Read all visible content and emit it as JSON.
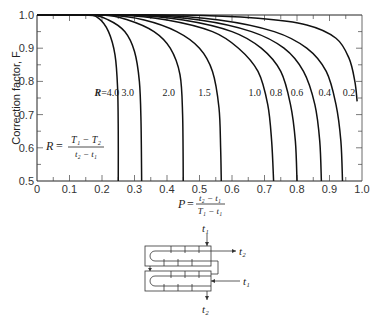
{
  "chart_data": {
    "type": "line",
    "title": "",
    "xlabel": "P = (t2 - t1) / (T1 - t1)",
    "ylabel": "Correction factor, F",
    "xlim": [
      0,
      1.0
    ],
    "ylim": [
      0.5,
      1.0
    ],
    "xticks": [
      "0",
      "0.1",
      "0.2",
      "0.3",
      "0.4",
      "0.5",
      "0.6",
      "0.7",
      "0.8",
      "0.9",
      "1.0"
    ],
    "yticks": [
      "0.5",
      "0.6",
      "0.7",
      "0.8",
      "0.9",
      "1.0"
    ],
    "grid": false,
    "parameter_legend": "R = (T1 - T2) / (t2 - t1)",
    "series": [
      {
        "name": "R=4.0",
        "label": "R=4.0",
        "points": [
          [
            0.0,
            1.0
          ],
          [
            0.15,
            1.0
          ],
          [
            0.19,
            0.99
          ],
          [
            0.22,
            0.95
          ],
          [
            0.24,
            0.88
          ],
          [
            0.248,
            0.78
          ],
          [
            0.25,
            0.65
          ],
          [
            0.25,
            0.5
          ]
        ]
      },
      {
        "name": "R=3.0",
        "label": "3.0",
        "points": [
          [
            0.0,
            1.0
          ],
          [
            0.16,
            1.0
          ],
          [
            0.22,
            0.985
          ],
          [
            0.27,
            0.95
          ],
          [
            0.3,
            0.89
          ],
          [
            0.315,
            0.8
          ],
          [
            0.32,
            0.68
          ],
          [
            0.322,
            0.5
          ]
        ]
      },
      {
        "name": "R=2.0",
        "label": "2.0",
        "points": [
          [
            0.0,
            1.0
          ],
          [
            0.2,
            1.0
          ],
          [
            0.28,
            0.985
          ],
          [
            0.36,
            0.95
          ],
          [
            0.41,
            0.9
          ],
          [
            0.44,
            0.82
          ],
          [
            0.448,
            0.7
          ],
          [
            0.45,
            0.5
          ]
        ]
      },
      {
        "name": "R=1.5",
        "label": "1.5",
        "points": [
          [
            0.0,
            1.0
          ],
          [
            0.22,
            1.0
          ],
          [
            0.33,
            0.985
          ],
          [
            0.43,
            0.95
          ],
          [
            0.5,
            0.9
          ],
          [
            0.54,
            0.83
          ],
          [
            0.56,
            0.72
          ],
          [
            0.565,
            0.6
          ],
          [
            0.567,
            0.5
          ]
        ]
      },
      {
        "name": "R=1.0",
        "label": "1.0",
        "points": [
          [
            0.0,
            1.0
          ],
          [
            0.25,
            1.0
          ],
          [
            0.4,
            0.985
          ],
          [
            0.54,
            0.95
          ],
          [
            0.62,
            0.9
          ],
          [
            0.68,
            0.83
          ],
          [
            0.71,
            0.73
          ],
          [
            0.722,
            0.62
          ],
          [
            0.728,
            0.5
          ]
        ]
      },
      {
        "name": "R=0.8",
        "label": "0.8",
        "points": [
          [
            0.0,
            1.0
          ],
          [
            0.28,
            1.0
          ],
          [
            0.45,
            0.985
          ],
          [
            0.6,
            0.95
          ],
          [
            0.69,
            0.9
          ],
          [
            0.75,
            0.83
          ],
          [
            0.78,
            0.73
          ],
          [
            0.795,
            0.62
          ],
          [
            0.8,
            0.5
          ]
        ]
      },
      {
        "name": "R=0.6",
        "label": "0.6",
        "points": [
          [
            0.0,
            1.0
          ],
          [
            0.3,
            1.0
          ],
          [
            0.5,
            0.985
          ],
          [
            0.66,
            0.95
          ],
          [
            0.76,
            0.9
          ],
          [
            0.82,
            0.83
          ],
          [
            0.855,
            0.73
          ],
          [
            0.87,
            0.62
          ],
          [
            0.875,
            0.5
          ]
        ]
      },
      {
        "name": "R=0.4",
        "label": "0.4",
        "points": [
          [
            0.0,
            1.0
          ],
          [
            0.35,
            1.0
          ],
          [
            0.56,
            0.985
          ],
          [
            0.73,
            0.95
          ],
          [
            0.83,
            0.9
          ],
          [
            0.89,
            0.83
          ],
          [
            0.92,
            0.73
          ],
          [
            0.935,
            0.62
          ],
          [
            0.94,
            0.5
          ]
        ]
      },
      {
        "name": "R=0.2",
        "label": "0.2",
        "points": [
          [
            0.0,
            1.0
          ],
          [
            0.45,
            1.0
          ],
          [
            0.68,
            0.99
          ],
          [
            0.83,
            0.97
          ],
          [
            0.92,
            0.93
          ],
          [
            0.96,
            0.87
          ],
          [
            0.978,
            0.8
          ],
          [
            0.985,
            0.74
          ]
        ]
      }
    ],
    "curve_label_positions": [
      {
        "label": "R=4.0",
        "x": 0.215,
        "y": 0.757
      },
      {
        "label": "3.0",
        "x": 0.279,
        "y": 0.757
      },
      {
        "label": "2.0",
        "x": 0.405,
        "y": 0.757
      },
      {
        "label": "1.5",
        "x": 0.515,
        "y": 0.757
      },
      {
        "label": "1.0",
        "x": 0.67,
        "y": 0.757
      },
      {
        "label": "0.8",
        "x": 0.735,
        "y": 0.757
      },
      {
        "label": "0.6",
        "x": 0.8,
        "y": 0.757
      },
      {
        "label": "0.4",
        "x": 0.885,
        "y": 0.757
      },
      {
        "label": "0.2",
        "x": 0.96,
        "y": 0.757
      }
    ]
  },
  "axes": {
    "ylabel": "Correction factor, F",
    "x_var": "P",
    "x_num": "t₂ − t₁",
    "x_den": "T₁ − t₁",
    "r_var": "R",
    "r_num": "T₁ − T₂",
    "r_den": "t₂ − t₁",
    "eq": "="
  },
  "diagram": {
    "inlet_top": "t₁",
    "outlet_right": "t₂",
    "inlet_right": "t₁",
    "outlet_bottom": "t₂"
  }
}
